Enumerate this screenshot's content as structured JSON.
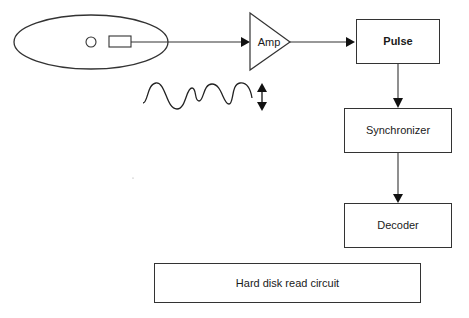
{
  "diagram": {
    "title": "Hard disk read circuit",
    "nodes": {
      "disk": {
        "shape": "ellipse",
        "contains": [
          "circle",
          "read-head-rectangle"
        ]
      },
      "amp": {
        "label": "Amp",
        "shape": "triangle"
      },
      "pulse": {
        "label": "Pulse",
        "shape": "box",
        "bold": true
      },
      "synchronizer": {
        "label": "Synchronizer",
        "shape": "box"
      },
      "decoder": {
        "label": "Decoder",
        "shape": "box"
      }
    },
    "edges": [
      {
        "from": "disk",
        "to": "amp"
      },
      {
        "from": "amp",
        "to": "pulse"
      },
      {
        "from": "pulse",
        "to": "synchronizer"
      },
      {
        "from": "synchronizer",
        "to": "decoder"
      }
    ],
    "annotations": {
      "waveform": "analog read signal waveform",
      "amplitude_arrow": "double-headed vertical arrow"
    },
    "caption": "Hard disk read circuit"
  }
}
